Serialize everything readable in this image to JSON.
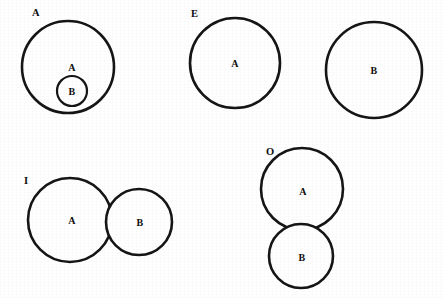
{
  "figure": {
    "width": 444,
    "height": 298,
    "background_color": "#ffffff",
    "ink_color": "#151515",
    "style": "scanned black-and-white line drawing"
  },
  "diagrams": [
    {
      "tag": "A",
      "tag_x": 32,
      "tag_y": 16,
      "relation": "containment",
      "circles": [
        {
          "label": "A",
          "cx": 68,
          "cy": 67,
          "r": 46,
          "label_x": 72,
          "label_y": 71,
          "stroke_class": "euler-circle"
        },
        {
          "label": "B",
          "cx": 72,
          "cy": 91,
          "r": 15,
          "label_x": 72,
          "label_y": 95,
          "stroke_class": "euler-circle thin"
        }
      ]
    },
    {
      "tag": "E",
      "tag_x": 191,
      "tag_y": 17,
      "relation": "disjoint",
      "circles": [
        {
          "label": "A",
          "cx": 235,
          "cy": 63,
          "r": 45,
          "label_x": 235,
          "label_y": 67,
          "stroke_class": "euler-circle"
        },
        {
          "label": "B",
          "cx": 374,
          "cy": 70,
          "r": 48,
          "label_x": 374,
          "label_y": 74,
          "stroke_class": "euler-circle"
        }
      ]
    },
    {
      "tag": "I",
      "tag_x": 24,
      "tag_y": 184,
      "relation": "overlap-horizontal",
      "circles": [
        {
          "label": "A",
          "cx": 70,
          "cy": 220,
          "r": 42,
          "label_x": 72,
          "label_y": 224,
          "stroke_class": "euler-circle"
        },
        {
          "label": "B",
          "cx": 139,
          "cy": 222,
          "r": 33,
          "label_x": 140,
          "label_y": 226,
          "stroke_class": "euler-circle"
        }
      ]
    },
    {
      "tag": "O",
      "tag_x": 266,
      "tag_y": 155,
      "relation": "overlap-vertical",
      "circles": [
        {
          "label": "A",
          "cx": 302,
          "cy": 189,
          "r": 41,
          "label_x": 303,
          "label_y": 195,
          "stroke_class": "euler-circle"
        },
        {
          "label": "B",
          "cx": 301,
          "cy": 256,
          "r": 32,
          "label_x": 302,
          "label_y": 261,
          "stroke_class": "euler-circle"
        }
      ]
    }
  ]
}
